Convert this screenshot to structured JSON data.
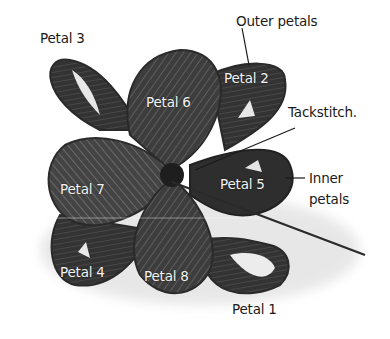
{
  "diagram": {
    "labels": {
      "petal_1": "Petal 1",
      "petal_2": "Petal 2",
      "petal_3": "Petal 3",
      "petal_4": "Petal 4",
      "petal_5": "Petal 5",
      "petal_6": "Petal 6",
      "petal_7": "Petal 7",
      "petal_8": "Petal 8",
      "outer_petals": "Outer petals",
      "tackstitch": "Tackstitch.",
      "inner_petals_line1": "Inner",
      "inner_petals_line2": "petals"
    },
    "colors": {
      "background": "#ffffff",
      "ribbon_dark": "#2e2e2e",
      "ribbon_mid": "#4a4a4a",
      "ribbon_light": "#6e6e6e",
      "label_dark": "#1a1a1a",
      "label_light": "#f2f2f2"
    }
  }
}
